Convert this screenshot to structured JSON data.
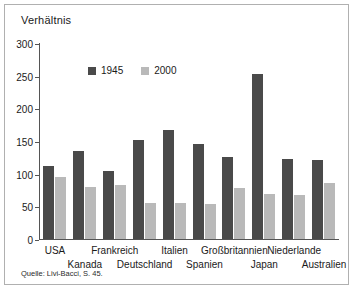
{
  "figure": {
    "title": "Verhältnis",
    "source": "Quelle: Livi-Bacci, S. 45."
  },
  "colors": {
    "series_1945": "#4a4a4a",
    "series_2000": "#b9b9b9",
    "axis": "#555555",
    "border": "#b0b0b0",
    "background": "#ffffff"
  },
  "chart_data": {
    "type": "bar",
    "title": "Verhältnis",
    "xlabel": "",
    "ylabel": "",
    "ylim": [
      0,
      300
    ],
    "yticks": [
      0,
      50,
      100,
      150,
      200,
      250,
      300
    ],
    "grid": false,
    "legend_position": "top-center",
    "categories": [
      "USA",
      "Kanada",
      "Frankreich",
      "Deutschland",
      "Italien",
      "Spanien",
      "Großbritannien",
      "Japan",
      "Niederlande",
      "Australien"
    ],
    "series": [
      {
        "name": "1945",
        "color": "#4a4a4a",
        "values": [
          112,
          134,
          104,
          152,
          167,
          145,
          126,
          252,
          122,
          121
        ]
      },
      {
        "name": "2000",
        "color": "#b9b9b9",
        "values": [
          95,
          80,
          82,
          55,
          55,
          54,
          78,
          69,
          68,
          86
        ]
      }
    ],
    "source": "Quelle: Livi-Bacci, S. 45."
  }
}
